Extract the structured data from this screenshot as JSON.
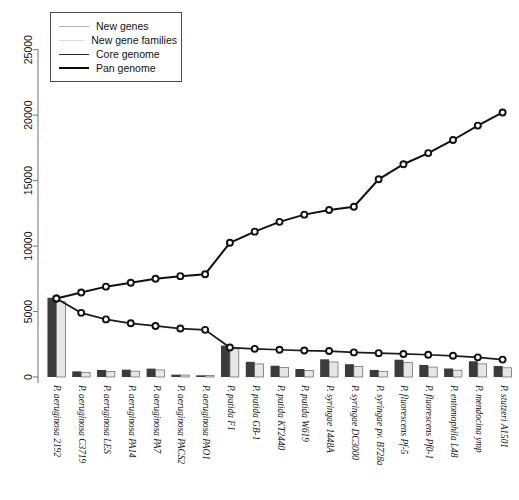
{
  "chart_data": {
    "type": "bar",
    "title": "",
    "xlabel": "",
    "ylabel": "",
    "ylim": [
      0,
      26500
    ],
    "ytick_values": [
      0,
      5000,
      10000,
      15000,
      20000,
      25000
    ],
    "ytick_labels": [
      "0",
      "5000",
      "10000",
      "15000",
      "20000",
      "25000"
    ],
    "grid": false,
    "legend_position": "top-left",
    "categories": [
      "P. aeruginosa 2192",
      "P. aeruginosa C3719",
      "P. aeruginosa LES",
      "P. aeruginosa PA14",
      "P. aeruginosa PA7",
      "P. aeruginosa PACS2",
      "P. aeruginosa PAO1",
      "P. putida F1",
      "P. putida GB-1",
      "P. putida KT2440",
      "P. putida W619",
      "P. syringae 1448A",
      "P. syringae DC3000",
      "P. syringae pv. B728a",
      "P. fluorescens Pf-5",
      "P. fluorescens Pf0-1",
      "P. entomophila L48",
      "P. mendocina ymp",
      "P. stutzeri A1501"
    ],
    "category_genus": [
      "P.",
      "P.",
      "P.",
      "P.",
      "P.",
      "P.",
      "P.",
      "P.",
      "P.",
      "P.",
      "P.",
      "P.",
      "P.",
      "P.",
      "P.",
      "P.",
      "P.",
      "P.",
      "P."
    ],
    "series": [
      {
        "name": "New genes",
        "type": "bar",
        "color": "#3b3b3b",
        "values": [
          6050,
          430,
          540,
          560,
          640,
          180,
          130,
          2400,
          1160,
          860,
          610,
          1350,
          980,
          540,
          1320,
          920,
          650,
          1200,
          840
        ]
      },
      {
        "name": "New gene families",
        "type": "bar",
        "color": "#e6e6e6",
        "values": [
          5750,
          360,
          430,
          450,
          540,
          150,
          110,
          2150,
          1000,
          720,
          500,
          1150,
          820,
          420,
          1120,
          760,
          520,
          1000,
          700
        ]
      },
      {
        "name": "Core genome",
        "type": "line",
        "color": "#1c1c1c",
        "values": [
          6000,
          4900,
          4400,
          4100,
          3900,
          3700,
          3600,
          2250,
          2150,
          2080,
          2020,
          1980,
          1880,
          1820,
          1760,
          1700,
          1620,
          1500,
          1330
        ]
      },
      {
        "name": "Pan genome",
        "type": "line",
        "color": "#111111",
        "values": [
          6000,
          6450,
          6900,
          7200,
          7500,
          7700,
          7850,
          10250,
          11100,
          11850,
          12400,
          12750,
          13000,
          15100,
          16250,
          17100,
          18100,
          19200,
          20200
        ]
      }
    ]
  },
  "legend": {
    "items": [
      {
        "label": "New genes",
        "color": "#b5b5b5",
        "weight": "1.6px"
      },
      {
        "label": "New gene families",
        "color": "#dcdcdc",
        "weight": "1.6px"
      },
      {
        "label": "Core genome",
        "color": "#2b2b2b",
        "weight": "1.9px"
      },
      {
        "label": "Pan genome",
        "color": "#0b0b0b",
        "weight": "2.6px"
      }
    ]
  }
}
